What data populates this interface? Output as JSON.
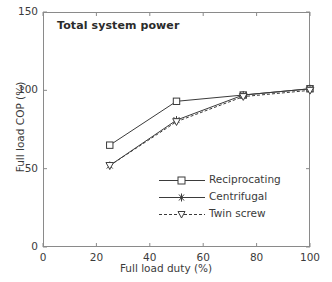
{
  "chart_data": {
    "type": "line",
    "title": "Total system power",
    "xlabel": "Full load duty (%)",
    "ylabel": "Full load COP (%)",
    "xlim": [
      0,
      100
    ],
    "ylim": [
      0,
      150
    ],
    "xticks": [
      0,
      20,
      40,
      60,
      80,
      100
    ],
    "yticks": [
      0,
      50,
      100,
      150
    ],
    "xtick_labels": [
      "0",
      "20",
      "40",
      "60",
      "80",
      "100"
    ],
    "ytick_labels": [
      "0",
      "50",
      "100",
      "150"
    ],
    "grid": false,
    "legend_position": "center",
    "x": [
      25,
      50,
      75,
      100
    ],
    "series": [
      {
        "name": "Reciprocating",
        "marker": "square-open",
        "linestyle": "solid",
        "color": "#3b3b3b",
        "values": [
          65,
          93,
          97,
          101
        ]
      },
      {
        "name": "Centrifugal",
        "marker": "x-cross",
        "linestyle": "solid",
        "color": "#3b3b3b",
        "values": [
          52,
          81,
          97,
          101
        ]
      },
      {
        "name": "Twin screw",
        "marker": "triangle-down-open",
        "linestyle": "dashed",
        "color": "#3b3b3b",
        "values": [
          52,
          80,
          96,
          100
        ]
      }
    ]
  },
  "legend": {
    "items": [
      {
        "label": "Reciprocating"
      },
      {
        "label": "Centrifugal"
      },
      {
        "label": "Twin screw"
      }
    ]
  }
}
